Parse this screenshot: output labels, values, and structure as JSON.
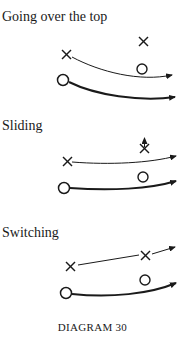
{
  "diagrams": [
    {
      "title": "Going over the top",
      "players": {
        "attackers": 2,
        "defenders": 2
      }
    },
    {
      "title": "Sliding",
      "players": {
        "attackers": 2,
        "defenders": 2
      }
    },
    {
      "title": "Switching",
      "players": {
        "attackers": 2,
        "defenders": 2
      }
    }
  ],
  "caption": "DIAGRAM 30",
  "legend_symbols": {
    "x": "attacker",
    "o": "defender"
  },
  "colors": {
    "ink": "#1a1a1a",
    "background": "#ffffff"
  }
}
